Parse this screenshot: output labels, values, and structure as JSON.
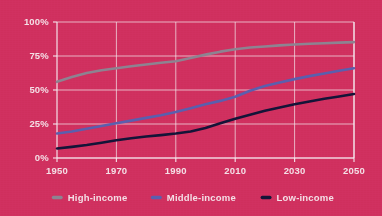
{
  "chart_data": {
    "type": "line",
    "title": "",
    "subtitle": "",
    "xlabel": "",
    "ylabel": "",
    "xlim": [
      1950,
      2050
    ],
    "ylim": [
      0,
      100
    ],
    "grid": true,
    "legend_position": "bottom",
    "x_tick_labels": [
      "1950",
      "1970",
      "1990",
      "2010",
      "2030",
      "2050"
    ],
    "x_ticks": [
      1950,
      1970,
      1990,
      2010,
      2030,
      2050
    ],
    "y_tick_labels": [
      "0%",
      "25%",
      "50%",
      "75%",
      "100%"
    ],
    "y_ticks": [
      0,
      25,
      50,
      75,
      100
    ],
    "x": [
      1950,
      1955,
      1960,
      1965,
      1970,
      1975,
      1980,
      1985,
      1990,
      1995,
      2000,
      2005,
      2010,
      2015,
      2020,
      2025,
      2030,
      2035,
      2040,
      2045,
      2050
    ],
    "series": [
      {
        "name": "High-income",
        "color": "#8d8391",
        "values": [
          56.0,
          59.5,
          62.5,
          64.5,
          66.0,
          67.5,
          68.8,
          70.0,
          71.2,
          73.5,
          76.0,
          78.2,
          80.0,
          81.2,
          82.0,
          82.8,
          83.5,
          84.0,
          84.4,
          84.8,
          85.2
        ]
      },
      {
        "name": "Middle-income",
        "color": "#5a5fae",
        "values": [
          18.0,
          19.5,
          21.5,
          23.5,
          25.5,
          27.5,
          29.5,
          31.5,
          33.8,
          36.5,
          39.5,
          42.0,
          45.0,
          49.5,
          53.0,
          55.5,
          58.0,
          60.2,
          62.2,
          64.2,
          66.0
        ]
      },
      {
        "name": "Low-income",
        "color": "#141438",
        "values": [
          7.0,
          8.2,
          9.5,
          11.2,
          13.0,
          14.5,
          15.8,
          16.8,
          18.0,
          19.5,
          22.0,
          25.5,
          28.8,
          31.8,
          34.8,
          37.2,
          39.5,
          41.5,
          43.5,
          45.2,
          47.0
        ]
      }
    ]
  },
  "legend": {
    "items": [
      {
        "label": "High-income",
        "color": "#8d8391"
      },
      {
        "label": "Middle-income",
        "color": "#5a5fae"
      },
      {
        "label": "Low-income",
        "color": "#141438"
      }
    ]
  },
  "theme": {
    "background": "#d0305f",
    "grid_color": "#f2e4ea",
    "text_color": "#f4dfe6"
  }
}
